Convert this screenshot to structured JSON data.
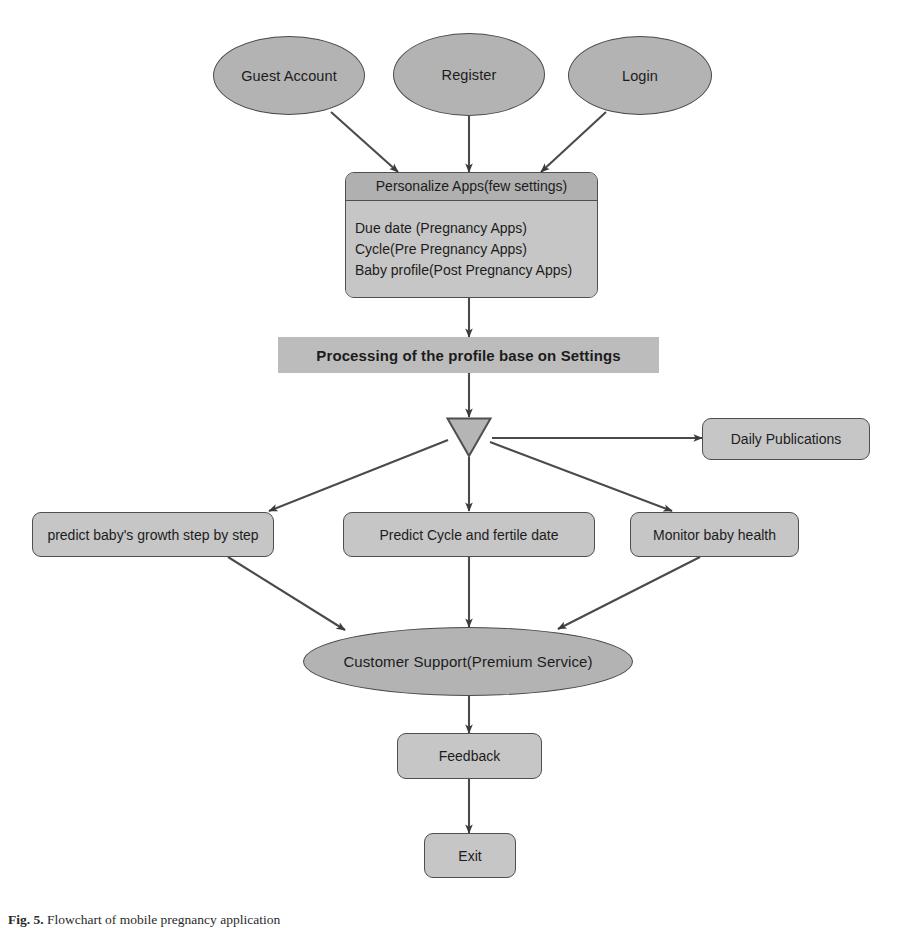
{
  "diagram": {
    "colors": {
      "ellipse_fill": "#b3b3b3",
      "box_fill": "#c6c6c6",
      "header_fill": "#b0b0b0",
      "bar_fill": "#bcbcbc",
      "stroke": "#4f4f4f",
      "text": "#1c1c1c",
      "background": "#ffffff"
    },
    "start_nodes": [
      {
        "id": "guest",
        "label": "Guest Account",
        "shape": "ellipse"
      },
      {
        "id": "register",
        "label": "Register",
        "shape": "ellipse"
      },
      {
        "id": "login",
        "label": "Login",
        "shape": "ellipse"
      }
    ],
    "personalize": {
      "header": "Personalize Apps(few settings)",
      "lines": [
        "Due date (Pregnancy Apps)",
        "Cycle(Pre Pregnancy Apps)",
        "Baby profile(Post Pregnancy Apps)"
      ]
    },
    "processing_bar": {
      "label": "Processing of the profile base on Settings"
    },
    "fork": {
      "label": "",
      "shape": "triangle-down"
    },
    "branch_nodes": [
      {
        "id": "daily",
        "label": "Daily Publications",
        "shape": "rrect"
      },
      {
        "id": "growth",
        "label": "predict baby's growth step by step",
        "shape": "rrect"
      },
      {
        "id": "cycle",
        "label": "Predict Cycle and fertile date",
        "shape": "rrect"
      },
      {
        "id": "monitor",
        "label": "Monitor baby health",
        "shape": "rrect"
      }
    ],
    "support": {
      "label": "Customer Support(Premium Service)",
      "shape": "ellipse"
    },
    "end_nodes": [
      {
        "id": "feedback",
        "label": "Feedback",
        "shape": "rrect"
      },
      {
        "id": "exit",
        "label": "Exit",
        "shape": "rrect"
      }
    ],
    "caption": {
      "prefix": "Fig. 5.",
      "text": "Flowchart of mobile pregnancy application"
    }
  }
}
